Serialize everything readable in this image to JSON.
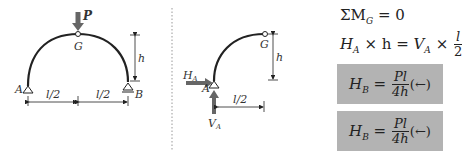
{
  "diagram1": {
    "load_label": "P",
    "hinge_label": "G",
    "support_left_label": "A",
    "support_right_label": "B",
    "height_label": "h",
    "span_left_label": "l/2",
    "span_right_label": "l/2"
  },
  "diagram2": {
    "hinge_label": "G",
    "support_label": "A",
    "height_label": "h",
    "span_label": "l/2",
    "horizontal_reaction": "H",
    "horizontal_reaction_sub": "A",
    "vertical_reaction": "V",
    "vertical_reaction_sub": "A"
  },
  "equations": {
    "moment_sum": "ΣM",
    "moment_sub": "G",
    "moment_rhs": "= 0",
    "eq2_lhs_var": "H",
    "eq2_lhs_sub": "A",
    "eq2_times1": "× h =",
    "eq2_rhs_var": "V",
    "eq2_rhs_sub": "A",
    "eq2_times2": "×",
    "eq2_num": "l",
    "eq2_den": "2",
    "result1": {
      "var": "H",
      "sub": "B",
      "eq": "=",
      "num": "Pl",
      "den": "4h",
      "dir": "(←)"
    },
    "result2": {
      "var": "H",
      "sub": "B",
      "eq": "=",
      "num": "Pl",
      "den": "4h",
      "dir": "(←)"
    }
  },
  "colors": {
    "line": "#222222",
    "box": "#b3b3b3",
    "arrow": "#666666"
  }
}
